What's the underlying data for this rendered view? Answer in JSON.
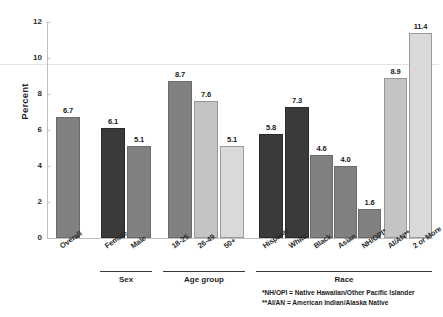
{
  "chart_data": {
    "type": "bar",
    "title": "",
    "xlabel": "",
    "ylabel": "Percent",
    "ylim": [
      0,
      12
    ],
    "yticks": [
      "0",
      "2",
      "4",
      "6",
      "8",
      "10",
      "12"
    ],
    "grid": false,
    "legend": "none",
    "categories": [
      "Overall",
      "Female",
      "Male",
      "18-25",
      "26-49",
      "50+",
      "Hispanic",
      "White",
      "Black",
      "Asian",
      "NH/OPI*",
      "AI/AN**",
      "2 or More"
    ],
    "values": [
      6.7,
      6.1,
      5.1,
      8.7,
      7.6,
      5.1,
      5.8,
      7.3,
      4.6,
      4.0,
      1.6,
      8.9,
      11.4
    ],
    "value_labels": [
      "6.7",
      "6.1",
      "5.1",
      "8.7",
      "7.6",
      "5.1",
      "5.8",
      "7.3",
      "4.6",
      "4.0",
      "1.6",
      "8.9",
      "11.4"
    ],
    "bar_shades": [
      "medium",
      "dark",
      "medium",
      "medium",
      "midlight",
      "light",
      "dark",
      "dark",
      "medium",
      "medium",
      "medium",
      "midlight",
      "light"
    ],
    "groups": [
      {
        "label": "Sex",
        "members": [
          "Female",
          "Male"
        ]
      },
      {
        "label": "Age group",
        "members": [
          "18-25",
          "26-49",
          "50+"
        ]
      },
      {
        "label": "Race",
        "members": [
          "Hispanic",
          "White",
          "Black",
          "Asian",
          "NH/OPI*",
          "AI/AN**",
          "2 or More"
        ]
      }
    ],
    "footnotes": [
      "*NH/OPI = Native Hawaiian/Other Pacific Islander",
      "**AI/AN = American Indian/Alaska Native"
    ],
    "colors": {
      "dark": "#3a3a3a",
      "medium": "#808080",
      "midlight": "#c4c4c4",
      "light": "#d9d9d9",
      "axis": "#bfbfbf",
      "text": "#1a1a1a"
    }
  }
}
